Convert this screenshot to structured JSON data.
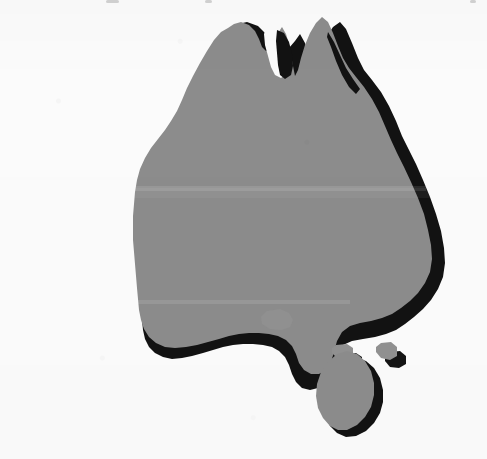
{
  "figure": {
    "kind": "map",
    "width": 487,
    "height": 459,
    "projection_note": "simple outline silhouette, no graticule",
    "has_labels": false,
    "has_legend": false,
    "has_scale_bar": false,
    "has_north_arrow": false,
    "has_border": false
  },
  "colors": {
    "background": "#fbfbfb",
    "landmass": "#8c8c8c",
    "drop_shadow": "#121212",
    "island": "#919191",
    "island_shadow": "#141414"
  },
  "lighting": {
    "style": "offset drop shadow",
    "shadow_offset_x": 9,
    "shadow_offset_y": 9,
    "shadowed_coasts": "south and east"
  },
  "regions": [
    {
      "name": "mainland-australia",
      "shadowed": true
    },
    {
      "name": "cape-york-peninsula",
      "shadowed": true
    },
    {
      "name": "gulf-of-carpentaria-notch",
      "shadowed": true
    },
    {
      "name": "arnhem-land",
      "shadowed": false
    },
    {
      "name": "western-australia-coast",
      "shadowed": false
    },
    {
      "name": "great-australian-bight",
      "shadowed": true
    },
    {
      "name": "eyre-peninsula",
      "shadowed": true
    },
    {
      "name": "yorke-peninsula",
      "shadowed": true
    },
    {
      "name": "kangaroo-island",
      "shadowed": true
    },
    {
      "name": "bass-strait-island-west",
      "shadowed": true
    },
    {
      "name": "bass-strait-island-east",
      "shadowed": true
    },
    {
      "name": "tasmania",
      "shadowed": true
    }
  ],
  "artifacts": {
    "paper_texture": "scanned halftone noise",
    "top_edge_specks": [
      {
        "left": 106,
        "width": 13
      },
      {
        "left": 205,
        "width": 7
      },
      {
        "left": 470,
        "width": 6
      }
    ],
    "scan_band_top": 188
  }
}
